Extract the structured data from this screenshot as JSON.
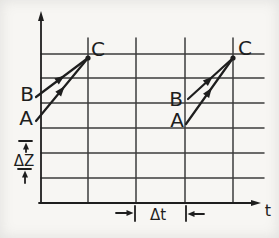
{
  "figure": {
    "background": "#f7f6f3",
    "ink": "#1e1e1e",
    "grid_color": "#3d3d3d",
    "canvas": {
      "width": 279,
      "height": 238
    },
    "y_axis": {
      "arrow_from": [
        41,
        203
      ],
      "arrow_tip": [
        41,
        11
      ]
    },
    "x_axis": {
      "arrow_from": [
        39,
        203
      ],
      "arrow_tip": [
        261,
        203
      ],
      "label": "t",
      "label_x": 268,
      "label_y": 216
    },
    "grid": {
      "h_lines": [
        54,
        78,
        103,
        128,
        153,
        178
      ],
      "h_x1": 41,
      "h_x2": 264,
      "v_lines": [
        88,
        136,
        185,
        233
      ],
      "v_y1": 38,
      "v_y2": 203
    },
    "meet_points": [
      {
        "name": "point-C-left",
        "x": 88,
        "y": 58
      },
      {
        "name": "point-C-right",
        "x": 233,
        "y": 58
      }
    ],
    "rays": [
      {
        "name": "left-B-to-C",
        "x1": 36,
        "y1": 97,
        "x2": 88,
        "y2": 58
      },
      {
        "name": "left-A-to-C",
        "x1": 36,
        "y1": 121,
        "x2": 88,
        "y2": 58
      },
      {
        "name": "right-B-to-C",
        "x1": 188,
        "y1": 99,
        "x2": 233,
        "y2": 58
      },
      {
        "name": "right-A-to-C",
        "x1": 186,
        "y1": 124,
        "x2": 233,
        "y2": 58
      }
    ],
    "labels": [
      {
        "name": "point-label-C-left",
        "text": "C",
        "x": 98,
        "y": 56,
        "size": 20
      },
      {
        "name": "point-label-C-right",
        "text": "C",
        "x": 245,
        "y": 55,
        "size": 20
      },
      {
        "name": "point-label-B-left",
        "text": "B",
        "x": 27,
        "y": 101,
        "size": 20
      },
      {
        "name": "point-label-A-left",
        "text": "A",
        "x": 26,
        "y": 125,
        "size": 20
      },
      {
        "name": "point-label-B-right",
        "text": "B",
        "x": 176,
        "y": 106,
        "size": 20
      },
      {
        "name": "point-label-A-right",
        "text": "A",
        "x": 177,
        "y": 127,
        "size": 20
      }
    ],
    "delta_z": {
      "label": "ΔZ",
      "label_x": 24,
      "label_y": 166,
      "label_size": 15,
      "ticks": [
        {
          "x1": 19,
          "y1": 141,
          "x2": 32,
          "y2": 141
        },
        {
          "x1": 18,
          "y1": 169,
          "x2": 31,
          "y2": 169
        }
      ],
      "arrows": [
        {
          "from": [
            26,
            152
          ],
          "tip": [
            26,
            142.5
          ]
        },
        {
          "from": [
            25,
            183
          ],
          "tip": [
            25,
            170.5
          ]
        }
      ]
    },
    "delta_t": {
      "label": "Δt",
      "label_x": 158,
      "label_y": 220,
      "label_size": 15,
      "ticks": [
        {
          "x1": 135,
          "y1": 206,
          "x2": 135,
          "y2": 221
        },
        {
          "x1": 186,
          "y1": 206,
          "x2": 186,
          "y2": 221
        }
      ],
      "arrows": [
        {
          "from": [
            116,
            213
          ],
          "tip": [
            133.5,
            213
          ]
        },
        {
          "from": [
            204,
            214
          ],
          "tip": [
            187.5,
            214
          ]
        }
      ]
    }
  }
}
